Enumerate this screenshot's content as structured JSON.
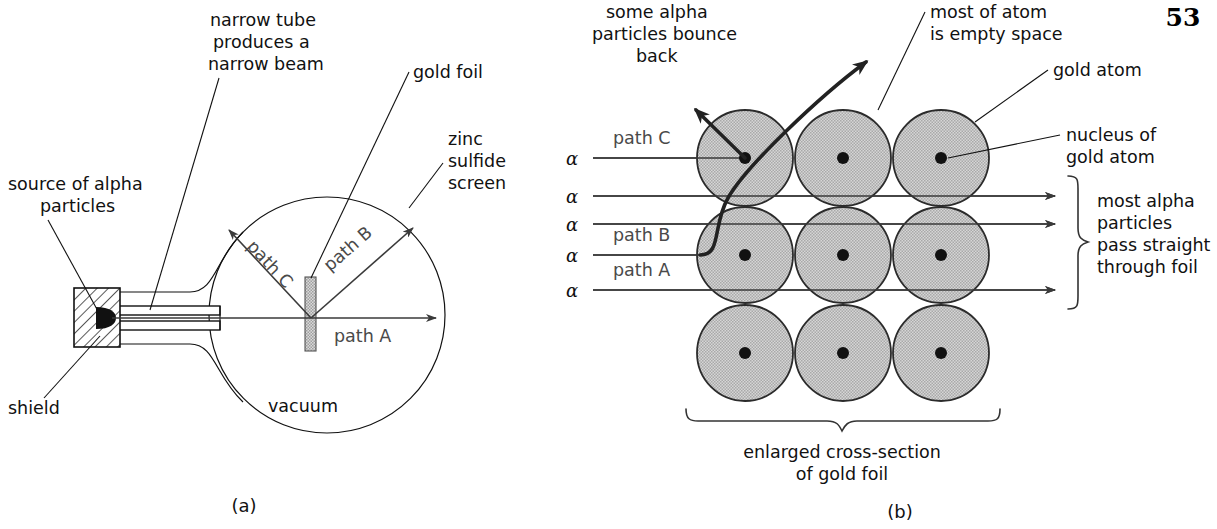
{
  "page": {
    "number": "53"
  },
  "panel_a": {
    "caption": "(a)",
    "labels": {
      "narrow_tube": [
        "narrow tube",
        "produces a",
        "narrow beam"
      ],
      "gold_foil": "gold foil",
      "zinc_sulfide_screen": [
        "zinc",
        "sulfide",
        "screen"
      ],
      "source_of_alpha": [
        "source of alpha",
        "particles"
      ],
      "shield": "shield",
      "vacuum": "vacuum",
      "path_a": "path A",
      "path_b": "path B",
      "path_c": "path C"
    }
  },
  "panel_b": {
    "caption": "(b)",
    "labels": {
      "bounce_back": [
        "some alpha",
        "particles bounce",
        "back"
      ],
      "empty_space": [
        "most of atom",
        "is empty space"
      ],
      "gold_atom": "gold atom",
      "nucleus_of_gold_atom": [
        "nucleus of",
        "gold atom"
      ],
      "most_pass_straight": [
        "most alpha",
        "particles",
        "pass straight",
        "through foil"
      ],
      "enlarged_cross_section": [
        "enlarged cross-section",
        "of gold foil"
      ],
      "path_a": "path A",
      "path_b": "path B",
      "path_c": "path C"
    },
    "alpha_symbol": "α",
    "alpha_rays": [
      {
        "label": "path C",
        "y": 158,
        "kind": "bounce-back"
      },
      {
        "label": "",
        "y": 196,
        "kind": "straight"
      },
      {
        "label": "",
        "y": 224,
        "kind": "straight"
      },
      {
        "label": "path B",
        "y": 255,
        "kind": "deflected"
      },
      {
        "label": "path A",
        "y": 290,
        "kind": "straight"
      }
    ],
    "atom_grid": {
      "rows": 3,
      "cols": 3,
      "centers_x": [
        745,
        843,
        941
      ],
      "centers_y": [
        158,
        255,
        353
      ],
      "radius": 48
    }
  },
  "colors": {
    "atom_fill": "#c9c9c9",
    "atom_stroke": "#2b2b2b",
    "nucleus": "#111111",
    "ray": "#3a3a3a",
    "label_text": "#111111",
    "gray_label_text": "#4a4a4a",
    "background": "#ffffff"
  }
}
